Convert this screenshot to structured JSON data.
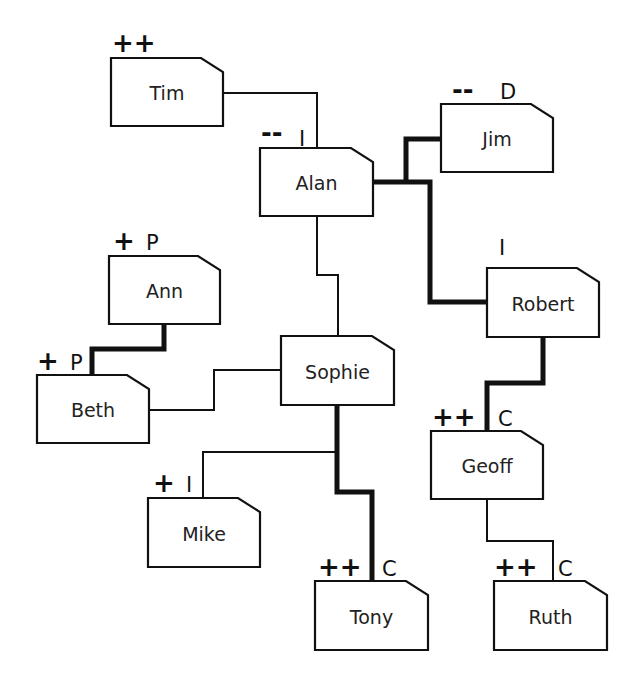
{
  "diagram": {
    "type": "stakeholder-network",
    "colors": {
      "line": "#111111",
      "box_fill": "#ffffff",
      "text": "#222222",
      "background": "#ffffff"
    },
    "nodes": [
      {
        "id": "tim",
        "label": "Tim",
        "rating": "++",
        "role": "",
        "box": [
          111,
          58,
          223,
          126
        ]
      },
      {
        "id": "alan",
        "label": "Alan",
        "rating": "--",
        "role": "I",
        "box": [
          260,
          148,
          373,
          216
        ]
      },
      {
        "id": "jim",
        "label": "Jim",
        "rating": "--",
        "role": "D",
        "box": [
          441,
          104,
          553,
          172
        ]
      },
      {
        "id": "robert",
        "label": "Robert",
        "rating": "",
        "role": "I",
        "box": [
          487,
          268,
          599,
          337
        ]
      },
      {
        "id": "ann",
        "label": "Ann",
        "rating": "+",
        "role": "P",
        "box": [
          109,
          256,
          220,
          324
        ]
      },
      {
        "id": "beth",
        "label": "Beth",
        "rating": "+",
        "role": "P",
        "box": [
          37,
          375,
          149,
          443
        ]
      },
      {
        "id": "sophie",
        "label": "Sophie",
        "rating": "",
        "role": "",
        "box": [
          281,
          336,
          394,
          405
        ]
      },
      {
        "id": "geoff",
        "label": "Geoff",
        "rating": "++",
        "role": "C",
        "box": [
          431,
          431,
          543,
          499
        ]
      },
      {
        "id": "mike",
        "label": "Mike",
        "rating": "+",
        "role": "I",
        "box": [
          148,
          498,
          260,
          567
        ]
      },
      {
        "id": "tony",
        "label": "Tony",
        "rating": "++",
        "role": "C",
        "box": [
          315,
          581,
          428,
          650
        ]
      },
      {
        "id": "ruth",
        "label": "Ruth",
        "rating": "++",
        "role": "C",
        "box": [
          494,
          581,
          607,
          650
        ]
      }
    ],
    "edges": [
      {
        "from": "tim",
        "to": "alan",
        "weight": "thin",
        "points": "223,93 317,93 317,148"
      },
      {
        "from": "alan",
        "to": "jim",
        "weight": "thick",
        "points": "406,182 406,139 441,139"
      },
      {
        "from": "alan",
        "to": "robert",
        "weight": "thick",
        "points": "373,182 430,182 430,302 487,302"
      },
      {
        "from": "alan",
        "to": "sophie",
        "weight": "thin",
        "points": "317,216 317,275 338,275 338,336"
      },
      {
        "from": "ann",
        "to": "beth",
        "weight": "thick",
        "points": "164,324 164,349 92,349 92,375"
      },
      {
        "from": "beth",
        "to": "sophie",
        "weight": "thin",
        "points": "149,410 214,410 214,370 281,370"
      },
      {
        "from": "sophie",
        "to": "mike",
        "weight": "thin",
        "points": "337,452 203,452 203,498"
      },
      {
        "from": "sophie",
        "to": "tony",
        "weight": "thick",
        "points": "337,405 337,492 372,492 372,581"
      },
      {
        "from": "robert",
        "to": "geoff",
        "weight": "thick",
        "points": "543,337 543,383 487,383 487,431"
      },
      {
        "from": "geoff",
        "to": "ruth",
        "weight": "thin",
        "points": "487,499 487,541 553,541 553,581"
      }
    ],
    "annotations": [
      {
        "node": "tim",
        "rating": {
          "text": "++",
          "x": 112,
          "y": 52
        }
      },
      {
        "node": "alan",
        "rating": {
          "text": "--",
          "x": 261,
          "y": 142
        },
        "role": {
          "text": "I",
          "x": 299,
          "y": 146
        }
      },
      {
        "node": "jim",
        "rating": {
          "text": "--",
          "x": 452,
          "y": 99
        },
        "role": {
          "text": "D",
          "x": 500,
          "y": 99
        }
      },
      {
        "node": "robert",
        "role": {
          "text": "I",
          "x": 499,
          "y": 255
        }
      },
      {
        "node": "ann",
        "rating": {
          "text": "+",
          "x": 113,
          "y": 250
        },
        "role": {
          "text": "P",
          "x": 146,
          "y": 250
        }
      },
      {
        "node": "beth",
        "rating": {
          "text": "+",
          "x": 37,
          "y": 370
        },
        "role": {
          "text": "P",
          "x": 70,
          "y": 370
        }
      },
      {
        "node": "mike",
        "rating": {
          "text": "+",
          "x": 153,
          "y": 492
        },
        "role": {
          "text": "I",
          "x": 186,
          "y": 492
        }
      },
      {
        "node": "tony",
        "rating": {
          "text": "++",
          "x": 318,
          "y": 576
        },
        "role": {
          "text": "C",
          "x": 382,
          "y": 576
        }
      },
      {
        "node": "geoff",
        "rating": {
          "text": "++",
          "x": 432,
          "y": 426
        },
        "role": {
          "text": "C",
          "x": 498,
          "y": 426
        }
      },
      {
        "node": "ruth",
        "rating": {
          "text": "++",
          "x": 494,
          "y": 576
        },
        "role": {
          "text": "C",
          "x": 558,
          "y": 576
        }
      }
    ]
  }
}
